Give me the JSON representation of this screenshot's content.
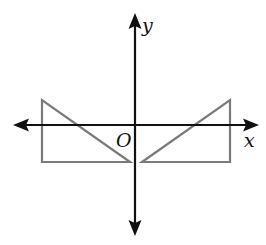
{
  "diagram": {
    "type": "coordinate-plane-reflection",
    "colors": {
      "axis": "#111111",
      "triangle_stroke": "#7a7a7a",
      "background": "#ffffff"
    },
    "axes": {
      "x_label": "x",
      "y_label": "y",
      "origin_label": "O",
      "origin_px": [
        135,
        125
      ],
      "x_range_px": [
        14,
        258
      ],
      "y_range_px": [
        14,
        235
      ]
    },
    "shapes": [
      {
        "name": "left-triangle",
        "points_px": [
          [
            42,
            100
          ],
          [
            42,
            162
          ],
          [
            130,
            162
          ]
        ]
      },
      {
        "name": "right-triangle",
        "points_px": [
          [
            230,
            100
          ],
          [
            230,
            162
          ],
          [
            142,
            162
          ]
        ]
      }
    ]
  }
}
